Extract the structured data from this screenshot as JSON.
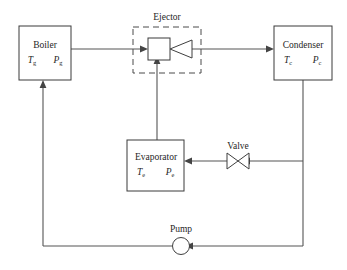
{
  "diagram": {
    "background_color": "#ffffff",
    "line_color": "#555555",
    "box_stroke_color": "#3a3a3a",
    "text_color": "#262626"
  },
  "components": {
    "boiler": {
      "name": "Boiler",
      "temperature_symbol": "T",
      "temperature_subscript": "g",
      "pressure_symbol": "P",
      "pressure_subscript": "g"
    },
    "condenser": {
      "name": "Condenser",
      "temperature_symbol": "T",
      "temperature_subscript": "c",
      "pressure_symbol": "P",
      "pressure_subscript": "c"
    },
    "evaporator": {
      "name": "Evaporator",
      "temperature_symbol": "T",
      "temperature_subscript": "e",
      "pressure_symbol": "P",
      "pressure_subscript": "e"
    },
    "ejector": {
      "name": "Ejector"
    },
    "valve": {
      "name": "Valve"
    },
    "pump": {
      "name": "Pump"
    }
  }
}
